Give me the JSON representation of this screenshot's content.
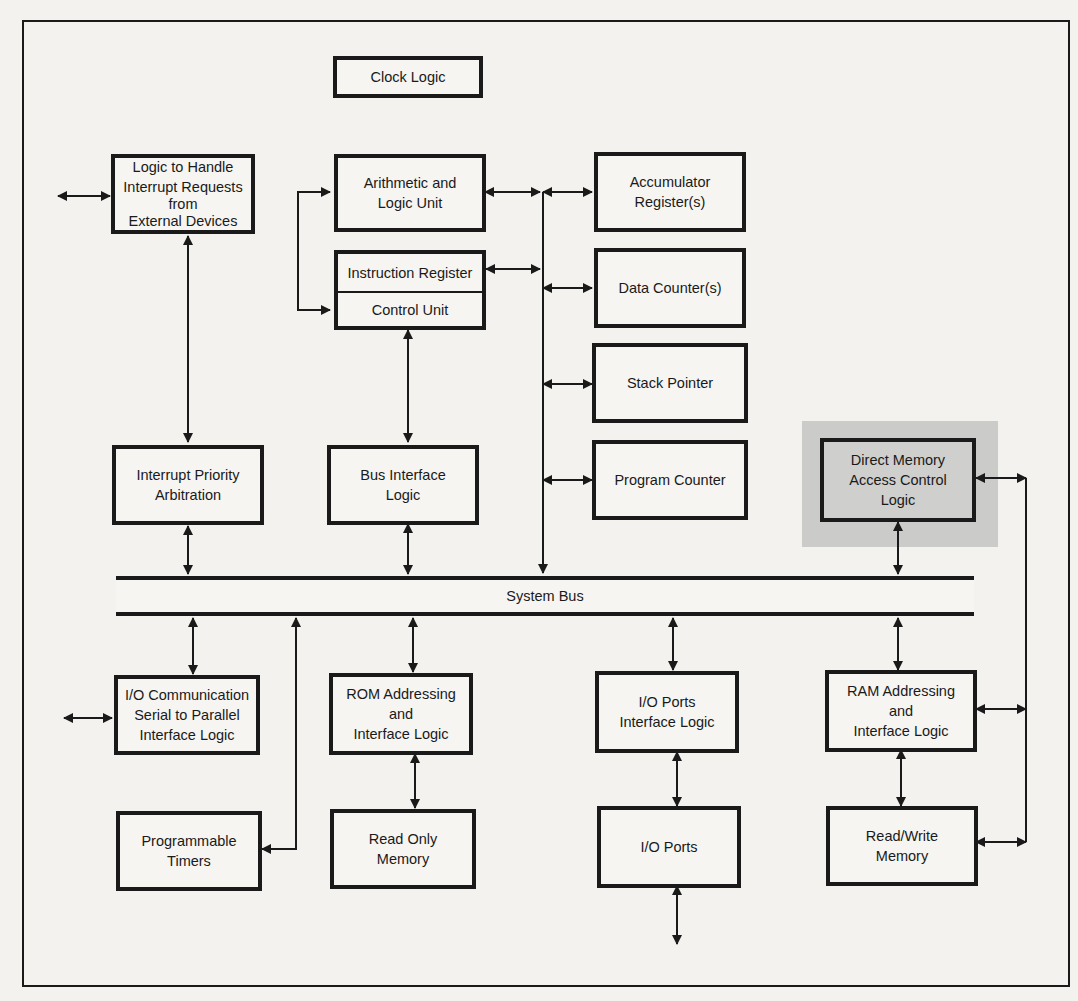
{
  "diagram": {
    "highlight_color": "#cbcbc9",
    "blocks": {
      "clock_logic": [
        "Clock Logic"
      ],
      "interrupt_request_logic": [
        "Logic to Handle",
        "Interrupt Requests",
        "from",
        "External Devices"
      ],
      "alu": [
        "Arithmetic and",
        "Logic Unit"
      ],
      "instruction_register": "Instruction Register",
      "control_unit": "Control Unit",
      "accumulator": [
        "Accumulator",
        "Register(s)"
      ],
      "data_counters": [
        "Data Counter(s)"
      ],
      "stack_pointer": [
        "Stack Pointer"
      ],
      "program_counter": [
        "Program Counter"
      ],
      "interrupt_priority": [
        "Interrupt Priority",
        "Arbitration"
      ],
      "bus_interface": [
        "Bus Interface",
        "Logic"
      ],
      "dma_control": [
        "Direct Memory",
        "Access Control",
        "Logic"
      ],
      "io_communication": [
        "I/O Communication",
        "Serial to Parallel",
        "Interface Logic"
      ],
      "rom_addressing": [
        "ROM Addressing",
        "and",
        "Interface Logic"
      ],
      "io_ports_interface": [
        "I/O Ports",
        "Interface Logic"
      ],
      "ram_addressing": [
        "RAM Addressing",
        "and",
        "Interface Logic"
      ],
      "programmable_timers": [
        "Programmable",
        "Timers"
      ],
      "read_only_memory": [
        "Read Only",
        "Memory"
      ],
      "io_ports": [
        "I/O Ports"
      ],
      "read_write_memory": [
        "Read/Write",
        "Memory"
      ]
    },
    "system_bus_label": "System Bus"
  }
}
